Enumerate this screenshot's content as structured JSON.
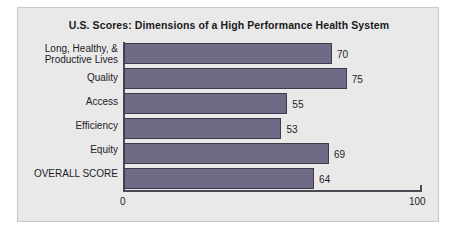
{
  "chart_data": {
    "type": "bar",
    "orientation": "horizontal",
    "title": "U.S. Scores: Dimensions of a High Performance Health System",
    "categories": [
      "Long, Healthy, &\nProductive Lives",
      "Quality",
      "Access",
      "Efficiency",
      "Equity",
      "OVERALL SCORE"
    ],
    "values": [
      70,
      75,
      55,
      53,
      69,
      64
    ],
    "value_labels": [
      "70",
      "75",
      "55",
      "53",
      "69",
      "64"
    ],
    "xlabel": "",
    "ylabel": "",
    "xlim": [
      0,
      100
    ],
    "xticks": [
      0,
      100
    ],
    "xtick_labels": [
      "0",
      "100"
    ],
    "grid": false,
    "legend": false,
    "bar_color": "#6f6b86",
    "bar_edge_color": "#3d3a4c",
    "axis_color": "#4a4a52",
    "panel_background": "#e9e9ea",
    "text_color": "#1d1d1d"
  }
}
